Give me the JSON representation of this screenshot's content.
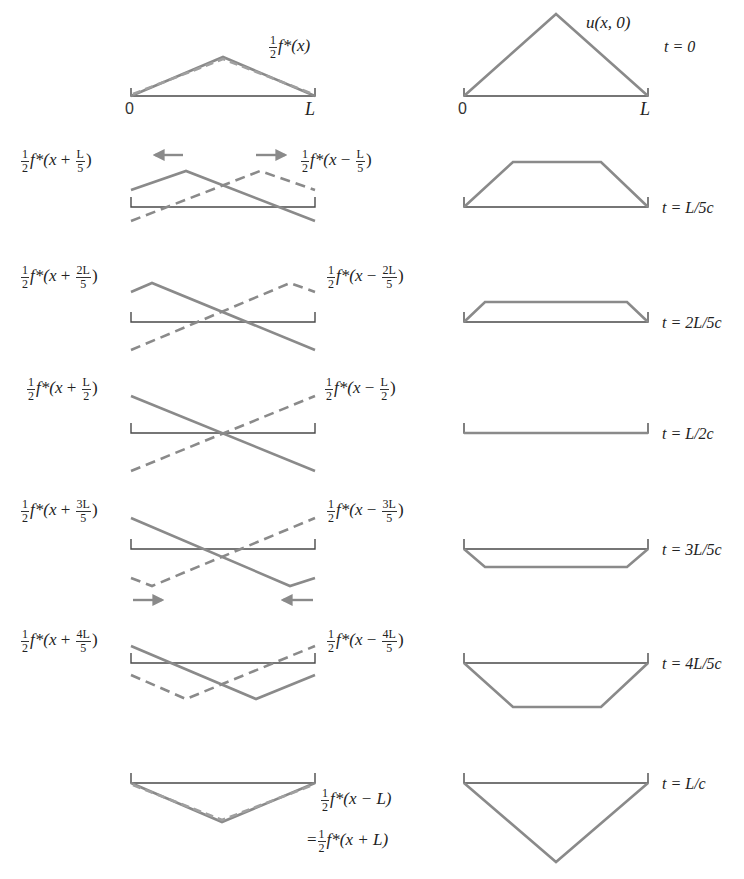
{
  "colors": {
    "wave": "#8a8a8a",
    "string": "#4a4a4a",
    "text": "#222222",
    "background": "#ffffff"
  },
  "axis": {
    "left_zero": "0",
    "left_L": "L",
    "right_zero": "0",
    "right_L": "L"
  },
  "top": {
    "left_label": {
      "coef_num": "1",
      "coef_den": "2",
      "func": "f*(x)"
    },
    "right_label": "u(x, 0)"
  },
  "rows": [
    {
      "time": "t = 0",
      "left_label": null,
      "right_label": null
    },
    {
      "time": "t = L/5c",
      "left_label": {
        "sign": "+",
        "shift_num": "L",
        "shift_den": "5"
      },
      "right_label": {
        "sign": "−",
        "shift_num": "L",
        "shift_den": "5"
      }
    },
    {
      "time": "t = 2L/5c",
      "left_label": {
        "sign": "+",
        "shift_num": "2L",
        "shift_den": "5"
      },
      "right_label": {
        "sign": "−",
        "shift_num": "2L",
        "shift_den": "5"
      }
    },
    {
      "time": "t = L/2c",
      "left_label": {
        "sign": "+",
        "shift_num": "L",
        "shift_den": "2"
      },
      "right_label": {
        "sign": "−",
        "shift_num": "L",
        "shift_den": "2"
      }
    },
    {
      "time": "t = 3L/5c",
      "left_label": {
        "sign": "+",
        "shift_num": "3L",
        "shift_den": "5"
      },
      "right_label": {
        "sign": "−",
        "shift_num": "3L",
        "shift_den": "5"
      }
    },
    {
      "time": "t = 4L/5c",
      "left_label": {
        "sign": "+",
        "shift_num": "4L",
        "shift_den": "5"
      },
      "right_label": {
        "sign": "−",
        "shift_num": "4L",
        "shift_den": "5"
      }
    },
    {
      "time": "t = L/c",
      "left_label": null,
      "right_label": null
    }
  ],
  "final_label": {
    "line1": {
      "coef_num": "1",
      "coef_den": "2",
      "func": "f*(x − L)"
    },
    "line2": {
      "prefix": "=",
      "coef_num": "1",
      "coef_den": "2",
      "func": "f*(x + L)"
    }
  },
  "frac_parts": {
    "half_num": "1",
    "half_den": "2",
    "fstar_open": "f*(x ",
    "close": ")"
  },
  "arrows": {
    "row1": [
      "left-arrow",
      "right-arrow"
    ],
    "row4": [
      "right-arrow",
      "left-arrow"
    ]
  }
}
